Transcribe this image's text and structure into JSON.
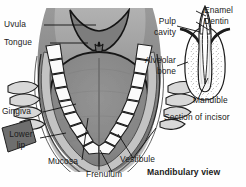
{
  "figure": {
    "title_main": "Mandibulary view",
    "title_inset": "Section of incisor",
    "main_labels": {
      "uvula": "Uvula",
      "tongue": "Tongue",
      "gingiva": "Gingiva",
      "lower_lip_line1": "Lower",
      "lower_lip_line2": "lip",
      "mucosa": "Mucosa",
      "frenulum": "Frenulum",
      "vestibule": "Vestibule"
    },
    "inset_labels": {
      "enamel": "Enamel",
      "dentin": "Dentin",
      "pulp_line1": "Pulp",
      "pulp_line2": "cavity",
      "alveolar_line1": "Alveolar",
      "alveolar_line2": "bone",
      "mandible": "Mandible"
    },
    "colors": {
      "background": "#fefefe",
      "tongue": "#8a8a8a",
      "tongue_dark": "#6f6f6f",
      "palate": "#a8a8a8",
      "lip_outer": "#909090",
      "lip_dark": "#6a6a6a",
      "gingiva": "#bdbdbd",
      "teeth": "#fbfbfb",
      "outline": "#1c1c1c",
      "leader": "#111111",
      "text": "#1a1a1a"
    }
  }
}
